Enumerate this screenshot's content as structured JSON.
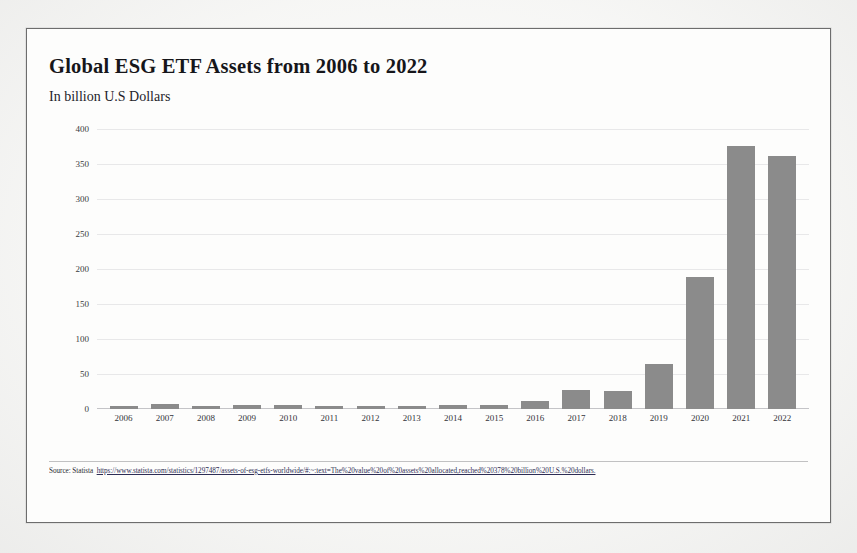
{
  "document": {
    "title": "Global ESG ETF Assets from 2006 to 2022",
    "subtitle": "In billion U.S Dollars",
    "source_label": "Source: Statista",
    "source_url": "https://www.statista.com/statistics/1297487/assets-of-esg-etfs-worldwide/#:~:text=The%20value%20of%20assets%20allocated,reached%20378%20billion%20U.S.%20dollars."
  },
  "colors": {
    "bar": "#8b8b8b",
    "page_background": "#fdfdfc",
    "frame_border": "#6d6d6d",
    "text": "#16161a",
    "gridline": "#c8c8cd"
  },
  "chart_data": {
    "type": "bar",
    "title": "Global ESG ETF Assets from 2006 to 2022",
    "subtitle": "In billion U.S Dollars",
    "xlabel": "",
    "ylabel": "In billion U.S Dollars",
    "ylim": [
      0,
      400
    ],
    "yticks": [
      0,
      50,
      100,
      150,
      200,
      250,
      300,
      350,
      400
    ],
    "grid": true,
    "legend": "none",
    "categories": [
      "2006",
      "2007",
      "2008",
      "2009",
      "2010",
      "2011",
      "2012",
      "2013",
      "2014",
      "2015",
      "2016",
      "2017",
      "2018",
      "2019",
      "2020",
      "2021",
      "2022"
    ],
    "values": [
      4,
      7,
      4,
      6,
      6,
      5,
      5,
      5,
      6,
      6,
      12,
      27,
      26,
      64,
      188,
      376,
      362
    ]
  }
}
